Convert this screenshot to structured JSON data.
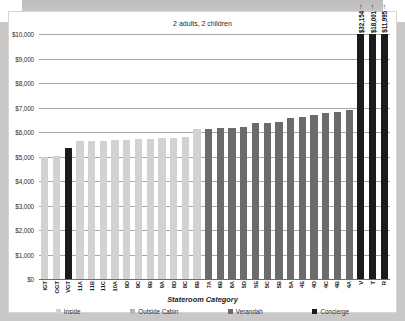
{
  "chart_title": "2 adults, 2 children",
  "axis_title": "Stateroom Category",
  "legend": [
    {
      "label": "Inside",
      "color": "#d2d2d2"
    },
    {
      "label": "Outside Cabin",
      "color": "#b5b5b5"
    },
    {
      "label": "Verandah",
      "color": "#6b6b6b"
    },
    {
      "label": "Concierge",
      "color": "#1b1b1b"
    }
  ],
  "colors": {
    "inside": "#d2d2d2",
    "outside": "#b5b5b5",
    "verandah": "#6b6b6b",
    "concierge": "#1b1b1b",
    "gridline": "#a9a8a6",
    "axis": "#6d6c6a",
    "card_bg": "#ffffff",
    "page_bg": "#c9c8c6"
  },
  "chart_data": {
    "type": "bar",
    "title": "2 adults, 2 children",
    "xlabel": "Stateroom Category",
    "ylabel": "",
    "ylim": [
      0,
      10000
    ],
    "ytick_step": 1000,
    "grid": true,
    "legend_position": "bottom",
    "ytick_labels": [
      "$10,000",
      "$9,000",
      "$8,000",
      "$7,000",
      "$6,000",
      "$5,000",
      "$4,000",
      "$3,000",
      "$2,000",
      "$1,000",
      "$0"
    ],
    "categories": [
      "IGT",
      "OGT",
      "VGT",
      "11A",
      "11B",
      "11C",
      "10A",
      "9D",
      "9C",
      "9B",
      "9A",
      "8D",
      "8C",
      "8B",
      "7A",
      "6B",
      "6A",
      "5D",
      "5E",
      "5C",
      "5B",
      "5A",
      "4E",
      "4D",
      "4C",
      "4B",
      "4A",
      "V",
      "T",
      "R"
    ],
    "series": [
      {
        "name": "Fare",
        "values": [
          5000,
          5030,
          5330,
          5620,
          5620,
          5640,
          5660,
          5680,
          5700,
          5720,
          5740,
          5760,
          5780,
          6120,
          6140,
          6150,
          6180,
          6200,
          6360,
          6380,
          6420,
          6560,
          6600,
          6700,
          6780,
          6820,
          6900,
          32154,
          18001,
          11995
        ]
      }
    ],
    "groups": [
      {
        "name": "Inside",
        "category_indexes": [
          0,
          1,
          3,
          4,
          5,
          6,
          7,
          8,
          9,
          10,
          11,
          12,
          13
        ]
      },
      {
        "name": "Outside Cabin",
        "category_indexes": []
      },
      {
        "name": "Verandah",
        "category_indexes": [
          14,
          15,
          16,
          17,
          18,
          19,
          20,
          21,
          22,
          23,
          24,
          25,
          26
        ]
      },
      {
        "name": "Concierge",
        "category_indexes": [
          2,
          27,
          28,
          29
        ]
      }
    ],
    "annotations": [
      {
        "category": "V",
        "text": "$32,154",
        "marker": "up-arrow",
        "note": "value exceeds axis maximum"
      },
      {
        "category": "T",
        "text": "$18,001",
        "marker": "up-arrow",
        "note": "value exceeds axis maximum"
      },
      {
        "category": "R",
        "text": "$11,995",
        "marker": "up-arrow",
        "note": "value exceeds axis maximum"
      }
    ],
    "bars": [
      {
        "category": "IGT",
        "value": 5000,
        "group": "Inside",
        "clipped": false
      },
      {
        "category": "OGT",
        "value": 5030,
        "group": "Inside",
        "clipped": false
      },
      {
        "category": "VGT",
        "value": 5330,
        "group": "Concierge",
        "clipped": false
      },
      {
        "category": "11A",
        "value": 5620,
        "group": "Inside",
        "clipped": false
      },
      {
        "category": "11B",
        "value": 5620,
        "group": "Inside",
        "clipped": false
      },
      {
        "category": "11C",
        "value": 5640,
        "group": "Inside",
        "clipped": false
      },
      {
        "category": "10A",
        "value": 5660,
        "group": "Inside",
        "clipped": false
      },
      {
        "category": "9D",
        "value": 5680,
        "group": "Inside",
        "clipped": false
      },
      {
        "category": "9C",
        "value": 5700,
        "group": "Inside",
        "clipped": false
      },
      {
        "category": "9B",
        "value": 5720,
        "group": "Inside",
        "clipped": false
      },
      {
        "category": "9A",
        "value": 5740,
        "group": "Inside",
        "clipped": false
      },
      {
        "category": "8D",
        "value": 5760,
        "group": "Inside",
        "clipped": false
      },
      {
        "category": "8C",
        "value": 5780,
        "group": "Inside",
        "clipped": false
      },
      {
        "category": "8B",
        "value": 6120,
        "group": "Inside",
        "clipped": false
      },
      {
        "category": "7A",
        "value": 6140,
        "group": "Verandah",
        "clipped": false
      },
      {
        "category": "6B",
        "value": 6150,
        "group": "Verandah",
        "clipped": false
      },
      {
        "category": "6A",
        "value": 6180,
        "group": "Verandah",
        "clipped": false
      },
      {
        "category": "5D",
        "value": 6200,
        "group": "Verandah",
        "clipped": false
      },
      {
        "category": "5E",
        "value": 6360,
        "group": "Verandah",
        "clipped": false
      },
      {
        "category": "5C",
        "value": 6380,
        "group": "Verandah",
        "clipped": false
      },
      {
        "category": "5B",
        "value": 6420,
        "group": "Verandah",
        "clipped": false
      },
      {
        "category": "5A",
        "value": 6560,
        "group": "Verandah",
        "clipped": false
      },
      {
        "category": "4E",
        "value": 6600,
        "group": "Verandah",
        "clipped": false
      },
      {
        "category": "4D",
        "value": 6700,
        "group": "Verandah",
        "clipped": false
      },
      {
        "category": "4C",
        "value": 6780,
        "group": "Verandah",
        "clipped": false
      },
      {
        "category": "4B",
        "value": 6820,
        "group": "Verandah",
        "clipped": false
      },
      {
        "category": "4A",
        "value": 6900,
        "group": "Verandah",
        "clipped": false
      },
      {
        "category": "V",
        "value": 32154,
        "group": "Concierge",
        "clipped": true
      },
      {
        "category": "T",
        "value": 18001,
        "group": "Concierge",
        "clipped": true
      },
      {
        "category": "R",
        "value": 11995,
        "group": "Concierge",
        "clipped": true
      }
    ]
  }
}
